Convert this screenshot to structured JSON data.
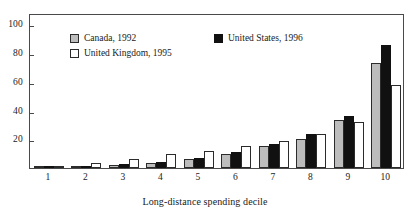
{
  "chart_data": {
    "type": "bar",
    "title": "",
    "subtitle": "",
    "xlabel": "Long-distance spending decile",
    "ylabel": "",
    "categories": [
      "1",
      "2",
      "3",
      "4",
      "5",
      "6",
      "7",
      "8",
      "9",
      "10"
    ],
    "ylim": [
      0,
      108
    ],
    "yticks": [
      20,
      40,
      60,
      80,
      100
    ],
    "ytick_labels": [
      "20",
      "40",
      "60",
      "80",
      "100"
    ],
    "grid": false,
    "legend_position": "top-left inside plot area",
    "series": [
      {
        "name": "Canada, 1992",
        "color": "#bdbdbd",
        "values": [
          0.3,
          0.8,
          2.0,
          3.5,
          6.0,
          9.5,
          15.0,
          20.5,
          33.5,
          73.0
        ]
      },
      {
        "name": "United States, 1996",
        "color": "#111111",
        "values": [
          1.5,
          1.5,
          2.5,
          4.5,
          7.0,
          11.0,
          16.5,
          23.5,
          36.0,
          86.0
        ]
      },
      {
        "name": "United Kingdom, 1995",
        "color": "#ffffff",
        "values": [
          0.3,
          3.5,
          6.0,
          10.0,
          12.0,
          15.0,
          18.5,
          24.0,
          32.0,
          58.0
        ]
      }
    ]
  },
  "legend": {
    "canada_label": "Canada, 1992",
    "uk_label": "United Kingdom, 1995",
    "us_label": "United States, 1996"
  },
  "axes": {
    "x_title": "Long-distance spending decile"
  }
}
